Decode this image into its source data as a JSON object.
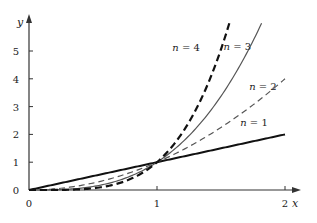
{
  "chart_data": {
    "type": "line",
    "title": "",
    "xlabel": "x",
    "ylabel": "y",
    "xlim": [
      0,
      2
    ],
    "ylim": [
      0,
      6
    ],
    "grid": false,
    "x_ticks": [
      "0",
      "1",
      "2"
    ],
    "y_ticks": [
      "0",
      "1",
      "2",
      "3",
      "4",
      "5"
    ],
    "series": [
      {
        "name": "n = 1",
        "function": "y = x^1",
        "style": "solid-thick",
        "color": "#111111",
        "label_pos": [
          1.65,
          2.3
        ]
      },
      {
        "name": "n = 2",
        "function": "y = x^2",
        "style": "dashed-thin",
        "color": "#555555",
        "label_pos": [
          1.72,
          3.6
        ]
      },
      {
        "name": "n = 3",
        "function": "y = x^3",
        "style": "solid-thin",
        "color": "#555555",
        "label_pos": [
          1.52,
          5.05
        ]
      },
      {
        "name": "n = 4",
        "function": "y = x^4",
        "style": "dashed-thick",
        "color": "#111111",
        "label_pos": [
          1.12,
          5.0
        ]
      }
    ],
    "annotations": [
      "n = 1",
      "n = 2",
      "n = 3",
      "n = 4"
    ],
    "intersection_point": [
      1,
      1
    ]
  }
}
